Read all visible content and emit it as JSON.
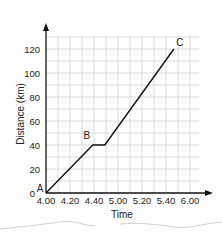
{
  "chart_data": {
    "type": "line",
    "title": "",
    "xlabel": "Time",
    "ylabel": "Distance (km)",
    "x_tick_labels": [
      "4.00",
      "4.20",
      "4.40",
      "5.00",
      "5.20",
      "5.40",
      "6.00"
    ],
    "y_tick_labels": [
      "0",
      "20",
      "40",
      "60",
      "80",
      "100",
      "120"
    ],
    "ylim": [
      0,
      130
    ],
    "grid": true,
    "legend": null,
    "series": [
      {
        "name": "Journey",
        "points": [
          {
            "label": "A",
            "x_index": 0,
            "y": 0
          },
          {
            "label": "B",
            "x_index": 1.95,
            "y": 40
          },
          {
            "label": "",
            "x_index": 2.45,
            "y": 40
          },
          {
            "label": "C",
            "x_index": 5.33,
            "y": 120
          }
        ]
      }
    ],
    "annotations": [
      "A",
      "B",
      "C"
    ]
  },
  "colors": {
    "line": "#111111",
    "grid": "#d0d0d0",
    "axis": "#111111",
    "background": "#ffffff"
  }
}
